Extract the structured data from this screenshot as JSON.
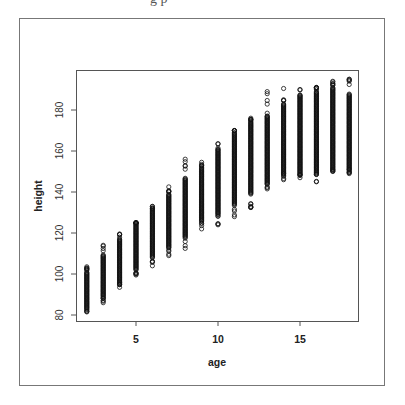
{
  "top_fragment": "g p",
  "chart_data": {
    "type": "scatter",
    "title": "",
    "xlabel": "age",
    "ylabel": "height",
    "xlim": [
      1.6,
      18.6
    ],
    "ylim": [
      78,
      198
    ],
    "xticks": [
      5,
      10,
      15
    ],
    "yticks": [
      80,
      100,
      120,
      140,
      160,
      180
    ],
    "grid": false,
    "legend": null,
    "marker": "open-circle",
    "series": [
      {
        "name": "height by age",
        "groups": [
          {
            "age": 2,
            "min": 81.5,
            "max": 103.5,
            "core_min": 83,
            "core_max": 101
          },
          {
            "age": 3,
            "min": 86,
            "max": 114,
            "core_min": 89,
            "core_max": 109
          },
          {
            "age": 4,
            "min": 93.5,
            "max": 119.5,
            "core_min": 96,
            "core_max": 117
          },
          {
            "age": 5,
            "min": 99.5,
            "max": 125,
            "core_min": 102,
            "core_max": 125
          },
          {
            "age": 6,
            "min": 104,
            "max": 133,
            "core_min": 108,
            "core_max": 132
          },
          {
            "age": 7,
            "min": 109,
            "max": 142.5,
            "core_min": 113,
            "core_max": 139
          },
          {
            "age": 8,
            "min": 112.5,
            "max": 156,
            "core_min": 118,
            "core_max": 147
          },
          {
            "age": 9,
            "min": 122,
            "max": 154.5,
            "core_min": 126,
            "core_max": 152
          },
          {
            "age": 10,
            "min": 124,
            "max": 163.5,
            "core_min": 129,
            "core_max": 160
          },
          {
            "age": 11,
            "min": 128,
            "max": 170,
            "core_min": 134,
            "core_max": 169
          },
          {
            "age": 12,
            "min": 132.5,
            "max": 176,
            "core_min": 139,
            "core_max": 174
          },
          {
            "age": 13,
            "min": 141.5,
            "max": 189,
            "core_min": 144,
            "core_max": 177
          },
          {
            "age": 14,
            "min": 146,
            "max": 190.5,
            "core_min": 149,
            "core_max": 183
          },
          {
            "age": 15,
            "min": 147,
            "max": 190,
            "core_min": 149,
            "core_max": 187
          },
          {
            "age": 16,
            "min": 145,
            "max": 191,
            "core_min": 149,
            "core_max": 189
          },
          {
            "age": 17,
            "min": 150,
            "max": 194,
            "core_min": 151,
            "core_max": 191
          },
          {
            "age": 18,
            "min": 149,
            "max": 195,
            "core_min": 151,
            "core_max": 188
          }
        ]
      }
    ]
  }
}
